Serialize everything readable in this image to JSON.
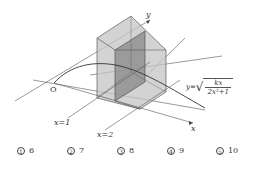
{
  "figure": {
    "origin_label": "O",
    "y_axis_label": "y",
    "x_axis_label": "x",
    "line_x1_label": "x=1",
    "line_x2_label": "x=2",
    "curve_formula": {
      "lhs": "y=",
      "numerator": "kx",
      "denominator": "2x²+1"
    },
    "colors": {
      "line": "#444444",
      "solid_fill_light": "#bdbdbd",
      "solid_fill_dark": "#8f8f8f"
    }
  },
  "choices": [
    {
      "marker": "1",
      "value": "6"
    },
    {
      "marker": "2",
      "value": "7"
    },
    {
      "marker": "3",
      "value": "8"
    },
    {
      "marker": "4",
      "value": "9"
    },
    {
      "marker": "5",
      "value": "10"
    }
  ]
}
